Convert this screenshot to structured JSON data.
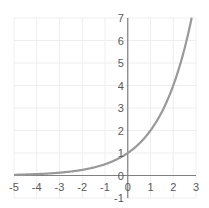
{
  "chart_data": {
    "type": "line",
    "title": "",
    "xlabel": "",
    "ylabel": "",
    "function": "y = 2^x",
    "xlim": [
      -5,
      3
    ],
    "ylim": [
      -1,
      7
    ],
    "grid": true,
    "legend": "none",
    "x_ticks": [
      "-5",
      "-4",
      "-3",
      "-2",
      "-1",
      "0",
      "1",
      "2",
      "3"
    ],
    "y_ticks": [
      "-1",
      "0",
      "1",
      "2",
      "3",
      "4",
      "5",
      "6",
      "7"
    ],
    "series": [
      {
        "name": "y = 2^x",
        "color": "#999999",
        "x": [
          -5,
          -4.5,
          -4,
          -3.5,
          -3,
          -2.5,
          -2,
          -1.5,
          -1,
          -0.5,
          0,
          0.5,
          1,
          1.5,
          2,
          2.5,
          2.81
        ],
        "values": [
          0.031,
          0.044,
          0.063,
          0.088,
          0.125,
          0.177,
          0.25,
          0.354,
          0.5,
          0.707,
          1,
          1.414,
          2,
          2.828,
          4,
          5.657,
          7
        ]
      }
    ]
  },
  "colors": {
    "grid": "#eeeeee",
    "axis": "#808080",
    "curve": "#999999",
    "labels": "#595959"
  }
}
